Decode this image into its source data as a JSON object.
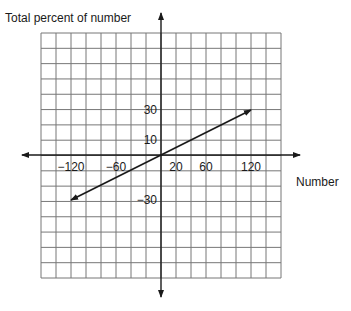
{
  "chart_data": {
    "type": "line",
    "title": "",
    "ylabel": "Total percent of number",
    "xlabel": "Number",
    "grid": true,
    "x_tick_labels": [
      {
        "value": -120,
        "label": "−120"
      },
      {
        "value": -60,
        "label": "−60"
      },
      {
        "value": 20,
        "label": "20"
      },
      {
        "value": 60,
        "label": "60"
      },
      {
        "value": 120,
        "label": "120"
      }
    ],
    "y_tick_labels": [
      {
        "value": 30,
        "label": "30"
      },
      {
        "value": 10,
        "label": "10"
      },
      {
        "value": -30,
        "label": "−30"
      }
    ],
    "series": [
      {
        "name": "percent line",
        "points": [
          {
            "x": -120,
            "y": -30
          },
          {
            "x": 120,
            "y": 30
          }
        ],
        "arrows": "both",
        "color": "#1a1a1a"
      }
    ],
    "grid_color": "#777777",
    "axis_color": "#1a1a1a"
  }
}
